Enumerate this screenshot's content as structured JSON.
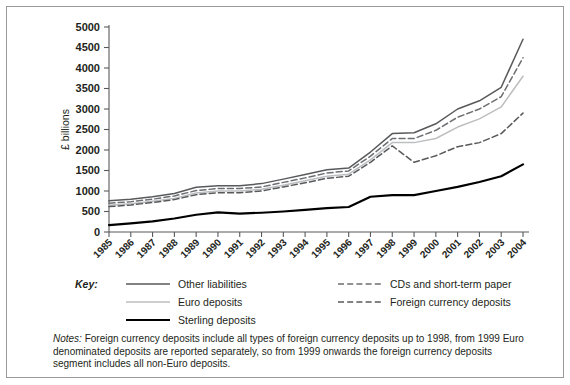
{
  "chart_data": {
    "type": "line",
    "title": "",
    "xlabel": "",
    "ylabel": "£ billions",
    "xlim": [
      1985,
      2004
    ],
    "ylim": [
      0,
      5000
    ],
    "ytick_step": 500,
    "grid": false,
    "legend_position": "below",
    "categories": [
      1985,
      1986,
      1987,
      1988,
      1989,
      1990,
      1991,
      1992,
      1993,
      1994,
      1995,
      1996,
      1997,
      1998,
      1999,
      2000,
      2001,
      2002,
      2003,
      2004
    ],
    "yticks": [
      0,
      500,
      1000,
      1500,
      2000,
      2500,
      3000,
      3500,
      4000,
      4500,
      5000
    ],
    "series": [
      {
        "name": "Other liabilities",
        "style": "solid",
        "color": "#58595b",
        "width": 1.5,
        "values": [
          760,
          800,
          860,
          940,
          1090,
          1130,
          1130,
          1180,
          1290,
          1400,
          1520,
          1560,
          1950,
          2400,
          2420,
          2640,
          3000,
          3200,
          3530,
          4700
        ]
      },
      {
        "name": "CDs and short-term paper",
        "style": "dashed",
        "color": "#6d6e71",
        "width": 1.5,
        "values": [
          700,
          740,
          800,
          880,
          1010,
          1060,
          1060,
          1100,
          1210,
          1320,
          1440,
          1490,
          1850,
          2280,
          2280,
          2480,
          2800,
          3000,
          3300,
          4250
        ]
      },
      {
        "name": "Euro deposits",
        "style": "solid",
        "color": "#bcbec0",
        "width": 1.5,
        "values": [
          650,
          690,
          750,
          820,
          950,
          1000,
          1000,
          1040,
          1140,
          1250,
          1360,
          1410,
          1760,
          2180,
          2180,
          2280,
          2560,
          2760,
          3050,
          3800
        ]
      },
      {
        "name": "Foreign currency deposits",
        "style": "dashed",
        "color": "#58595b",
        "width": 1.5,
        "values": [
          620,
          660,
          720,
          790,
          910,
          960,
          960,
          1000,
          1100,
          1200,
          1310,
          1360,
          1700,
          2100,
          1700,
          1860,
          2080,
          2180,
          2400,
          2900
        ]
      },
      {
        "name": "Sterling deposits",
        "style": "solid",
        "color": "#000000",
        "width": 2.2,
        "values": [
          170,
          210,
          260,
          330,
          420,
          480,
          450,
          470,
          500,
          540,
          580,
          610,
          860,
          900,
          900,
          1000,
          1100,
          1220,
          1360,
          1650
        ]
      }
    ]
  },
  "legend": {
    "key_label": "Key:",
    "entries": [
      {
        "label": "Other liabilities",
        "series": "Other liabilities"
      },
      {
        "label": "CDs and short-term paper",
        "series": "CDs and short-term paper"
      },
      {
        "label": "Euro deposits",
        "series": "Euro deposits"
      },
      {
        "label": "Foreign currency deposits",
        "series": "Foreign currency deposits"
      },
      {
        "label": "Sterling deposits",
        "series": "Sterling deposits"
      }
    ]
  },
  "notes": {
    "label": "Notes:",
    "text": " Foreign currency deposits include all types of foreign currency deposits up to 1998, from 1999 Euro denominated deposits are reported separately, so from 1999 onwards the foreign currency deposits segment includes all non-Euro deposits."
  }
}
